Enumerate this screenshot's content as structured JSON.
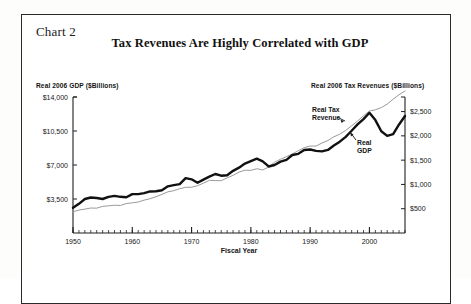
{
  "figure": {
    "chart_number_label": "Chart 2",
    "title": "Tax Revenues Are Highly Correlated with GDP"
  },
  "axes": {
    "left_heading": "Real 2006 GDP ($Billions)",
    "right_heading": "Real 2006 Tax Revenues ($Billions)",
    "x_title": "Fiscal Year"
  },
  "annotations": {
    "tax_line_1": "Real Tax",
    "tax_line_2": "Revenue",
    "gdp_line_1": "Real",
    "gdp_line_2": "GDP"
  },
  "colors": {
    "tax_revenue_line": "#111111",
    "gdp_line": "#9a9a9a",
    "axis": "#202020",
    "frame": "#2b2b2b",
    "page": "#ffffff"
  },
  "chart_data": {
    "type": "line",
    "title": "Tax Revenues Are Highly Correlated with GDP",
    "subtitle": "Chart 2",
    "xlabel": "Fiscal Year",
    "ylabel": "Real 2006 GDP ($Billions)",
    "y2label": "Real 2006 Tax Revenues ($Billions)",
    "grid": false,
    "legend": "inline-annotations",
    "xlim": [
      1950,
      2006
    ],
    "xticks": [
      1950,
      1960,
      1970,
      1980,
      1990,
      2000
    ],
    "xtick_labels": [
      "1950",
      "1960",
      "1970",
      "1980",
      "1990",
      "2000"
    ],
    "x_minor_tick_interval": 1,
    "ylim": [
      0,
      14000
    ],
    "yticks": [
      3500,
      7000,
      10500,
      14000
    ],
    "ytick_labels": [
      "$3,500",
      "$7,000",
      "$10,500",
      "$14,000"
    ],
    "y2lim": [
      0,
      2800
    ],
    "y2ticks": [
      500,
      1000,
      1500,
      2000,
      2500
    ],
    "y2tick_labels": [
      "$500",
      "$1,000",
      "$1,500",
      "$2,000",
      "$2,500"
    ],
    "x": [
      1950,
      1951,
      1952,
      1953,
      1954,
      1955,
      1956,
      1957,
      1958,
      1959,
      1960,
      1961,
      1962,
      1963,
      1964,
      1965,
      1966,
      1967,
      1968,
      1969,
      1970,
      1971,
      1972,
      1973,
      1974,
      1975,
      1976,
      1977,
      1978,
      1979,
      1980,
      1981,
      1982,
      1983,
      1984,
      1985,
      1986,
      1987,
      1988,
      1989,
      1990,
      1991,
      1992,
      1993,
      1994,
      1995,
      1996,
      1997,
      1998,
      1999,
      2000,
      2001,
      2002,
      2003,
      2004,
      2005,
      2006
    ],
    "series": [
      {
        "name": "Real Tax Revenue",
        "axis": "right",
        "units": "$Billions (2006 dollars)",
        "style": "thick-black-line",
        "values": [
          520,
          600,
          700,
          730,
          720,
          700,
          745,
          765,
          745,
          735,
          800,
          800,
          820,
          855,
          860,
          880,
          960,
          985,
          1005,
          1130,
          1105,
          1035,
          1100,
          1160,
          1215,
          1180,
          1190,
          1280,
          1345,
          1430,
          1480,
          1530,
          1475,
          1370,
          1400,
          1470,
          1505,
          1605,
          1630,
          1710,
          1720,
          1690,
          1680,
          1710,
          1800,
          1880,
          1980,
          2105,
          2235,
          2345,
          2475,
          2325,
          2095,
          2000,
          2035,
          2235,
          2410
        ]
      },
      {
        "name": "Real GDP",
        "axis": "left",
        "units": "$Billions (2006 dollars)",
        "style": "thin-gray-line",
        "values": [
          2184,
          2360,
          2456,
          2571,
          2556,
          2739,
          2797,
          2856,
          2835,
          3031,
          3109,
          3189,
          3383,
          3530,
          3734,
          3976,
          4239,
          4354,
          4562,
          4704,
          4713,
          4870,
          5131,
          5424,
          5396,
          5385,
          5675,
          5937,
          6267,
          6466,
          6450,
          6618,
          6491,
          6792,
          7285,
          7594,
          7861,
          8133,
          8475,
          8786,
          8955,
          8948,
          9267,
          9521,
          9906,
          10175,
          10561,
          11035,
          11526,
          12066,
          12560,
          12682,
          12909,
          13271,
          13774,
          14235,
          14615
        ]
      }
    ],
    "notes": [
      "Two series plotted on dual axes; they track each other closely.",
      "Real tax revenue peaks near 2000, falls through 2003, then rebounds by 2006."
    ]
  }
}
